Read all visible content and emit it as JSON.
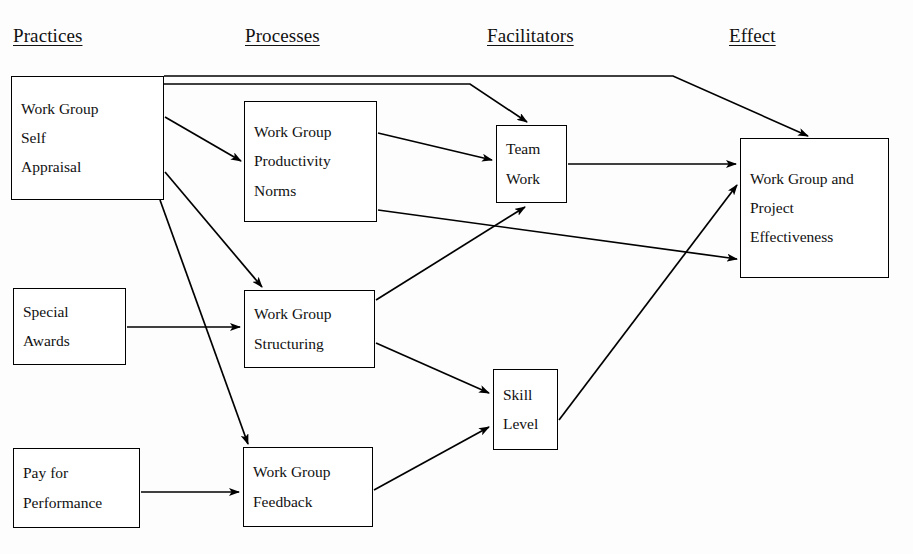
{
  "diagram": {
    "line_color": "#000000",
    "box_fill": "#ffffff",
    "background": "#fdfdfd"
  },
  "columns": [
    {
      "id": "practices",
      "label": "Practices",
      "x": 13,
      "y": 26
    },
    {
      "id": "processes",
      "label": "Processes",
      "x": 245,
      "y": 26
    },
    {
      "id": "facilitators",
      "label": "Facilitators",
      "x": 487,
      "y": 26
    },
    {
      "id": "effect",
      "label": "Effect",
      "x": 729,
      "y": 26
    }
  ],
  "nodes": [
    {
      "id": "work-group-self-appraisal",
      "lines": [
        "Work Group",
        "Self",
        "Appraisal"
      ],
      "x": 11,
      "y": 76,
      "w": 153,
      "h": 124
    },
    {
      "id": "work-group-productivity-norms",
      "lines": [
        "Work Group",
        "Productivity",
        "Norms"
      ],
      "x": 244,
      "y": 101,
      "w": 133,
      "h": 121
    },
    {
      "id": "team-work",
      "lines": [
        "Team",
        "Work"
      ],
      "x": 496,
      "y": 125,
      "w": 71,
      "h": 78
    },
    {
      "id": "work-group-and-project-effectiveness",
      "lines": [
        "Work Group and",
        "Project",
        "Effectiveness"
      ],
      "x": 740,
      "y": 138,
      "w": 149,
      "h": 140
    },
    {
      "id": "special-awards",
      "lines": [
        "Special",
        "Awards"
      ],
      "x": 13,
      "y": 288,
      "w": 113,
      "h": 77
    },
    {
      "id": "work-group-structuring",
      "lines": [
        "Work Group",
        "Structuring"
      ],
      "x": 244,
      "y": 290,
      "w": 131,
      "h": 78
    },
    {
      "id": "skill-level",
      "lines": [
        "Skill",
        "Level"
      ],
      "x": 493,
      "y": 369,
      "w": 65,
      "h": 81
    },
    {
      "id": "pay-for-performance",
      "lines": [
        "Pay for",
        "Performance"
      ],
      "x": 13,
      "y": 448,
      "w": 127,
      "h": 80
    },
    {
      "id": "work-group-feedback",
      "lines": [
        "Work Group",
        "Feedback"
      ],
      "x": 243,
      "y": 447,
      "w": 130,
      "h": 80
    }
  ],
  "edges": [
    {
      "id": "appraisal-to-effectiveness",
      "from": "work-group-self-appraisal",
      "to": "work-group-and-project-effectiveness",
      "points": "164,76 673,76 808,136"
    },
    {
      "id": "appraisal-to-team-work",
      "from": "work-group-self-appraisal",
      "to": "team-work",
      "points": "164,84 470,84 527,122"
    },
    {
      "id": "appraisal-to-productivity-norms",
      "from": "work-group-self-appraisal",
      "to": "work-group-productivity-norms",
      "points": "165,117 241,161"
    },
    {
      "id": "appraisal-to-structuring",
      "from": "work-group-self-appraisal",
      "to": "work-group-structuring",
      "points": "165,172 262,287"
    },
    {
      "id": "appraisal-to-feedback",
      "from": "work-group-self-appraisal",
      "to": "work-group-feedback",
      "points": "160,200 248,444"
    },
    {
      "id": "productivity-norms-to-team-work",
      "from": "work-group-productivity-norms",
      "to": "team-work",
      "points": "378,133 492,160"
    },
    {
      "id": "productivity-norms-to-effectiveness",
      "from": "work-group-productivity-norms",
      "to": "work-group-and-project-effectiveness",
      "points": "378,210 737,259"
    },
    {
      "id": "special-awards-to-structuring",
      "from": "special-awards",
      "to": "work-group-structuring",
      "points": "127,327 240,327"
    },
    {
      "id": "structuring-to-team-work",
      "from": "work-group-structuring",
      "to": "team-work",
      "points": "376,300 525,207"
    },
    {
      "id": "structuring-to-skill-level",
      "from": "work-group-structuring",
      "to": "skill-level",
      "points": "376,343 489,393"
    },
    {
      "id": "pay-for-performance-to-feedback",
      "from": "pay-for-performance",
      "to": "work-group-feedback",
      "points": "141,492 239,492"
    },
    {
      "id": "feedback-to-skill-level",
      "from": "work-group-feedback",
      "to": "skill-level",
      "points": "374,490 489,427"
    },
    {
      "id": "skill-level-to-effectiveness",
      "from": "skill-level",
      "to": "work-group-and-project-effectiveness",
      "points": "559,420 737,185"
    },
    {
      "id": "team-work-to-effectiveness",
      "from": "team-work",
      "to": "work-group-and-project-effectiveness",
      "points": "568,164 736,164"
    }
  ]
}
